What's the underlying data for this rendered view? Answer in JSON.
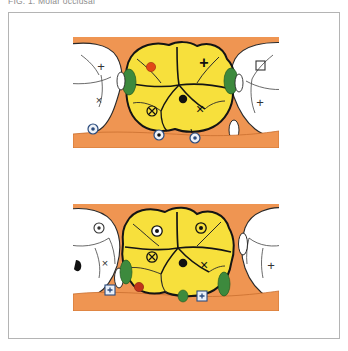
{
  "caption": {
    "text": "FIG. 1. Molar occlusal"
  },
  "figure": {
    "panels": [
      {
        "id": "panel-top",
        "label": "upper-molar-occlusal-view",
        "background_color": "#ef9552",
        "center_tooth": {
          "label": "central-molar-crown",
          "fill_color": "#f7e03c",
          "outline_color": "#1a1a1a"
        },
        "adjacent_teeth": [
          {
            "label": "left-adjacent-tooth",
            "fill_color": "#ffffff"
          },
          {
            "label": "right-adjacent-tooth",
            "fill_color": "#ffffff"
          }
        ],
        "interproximal_markers": [
          {
            "label": "mesial-contact-marker",
            "color": "#3d8a3d"
          },
          {
            "label": "distal-contact-marker",
            "color": "#3d8a3d"
          }
        ],
        "markers": [
          {
            "name": "red-dot-marker",
            "glyph": "●",
            "color": "#e24816"
          },
          {
            "name": "black-dot-marker",
            "glyph": "●",
            "color": "#111111"
          },
          {
            "name": "plus-marker",
            "glyph": "+",
            "color": "#111111"
          },
          {
            "name": "cross-marker-right",
            "glyph": "×",
            "color": "#111111"
          },
          {
            "name": "cross-marker-left",
            "glyph": "×",
            "color": "#333333"
          },
          {
            "name": "plus-marker-left",
            "glyph": "+",
            "color": "#333333"
          },
          {
            "name": "circled-cross-marker",
            "glyph": "⊗",
            "color": "#111111"
          },
          {
            "name": "square-marker-right",
            "glyph": "□",
            "color": "#333333"
          },
          {
            "name": "plus-marker-far-right",
            "glyph": "+",
            "color": "#333333"
          },
          {
            "name": "circled-dot-marker-1",
            "glyph": "◎",
            "color": "#2b4c7e"
          },
          {
            "name": "circled-dot-marker-2",
            "glyph": "◎",
            "color": "#2b4c7e"
          },
          {
            "name": "circled-dot-marker-3",
            "glyph": "◎",
            "color": "#2b4c7e"
          }
        ]
      },
      {
        "id": "panel-bottom",
        "label": "lower-molar-occlusal-view",
        "background_color": "#ef9552",
        "center_tooth": {
          "label": "central-molar-crown",
          "fill_color": "#f7e03c",
          "outline_color": "#1a1a1a"
        },
        "adjacent_teeth": [
          {
            "label": "left-adjacent-tooth",
            "fill_color": "#ffffff"
          },
          {
            "label": "right-adjacent-tooth",
            "fill_color": "#ffffff"
          }
        ],
        "interproximal_markers": [
          {
            "label": "mesial-contact-marker",
            "color": "#3d8a3d"
          },
          {
            "label": "distal-contact-marker",
            "color": "#3d8a3d"
          },
          {
            "label": "buccal-contact-marker",
            "color": "#3d8a3d"
          }
        ],
        "markers": [
          {
            "name": "circled-dot-marker-crown-left",
            "glyph": "◉",
            "color": "#111111"
          },
          {
            "name": "circled-dot-marker-crown-right",
            "glyph": "◎",
            "color": "#111111"
          },
          {
            "name": "circled-cross-marker",
            "glyph": "⊗",
            "color": "#111111"
          },
          {
            "name": "black-dot-marker",
            "glyph": "●",
            "color": "#111111"
          },
          {
            "name": "cross-marker-crown",
            "glyph": "×",
            "color": "#111111"
          },
          {
            "name": "circled-dot-marker-left-tooth",
            "glyph": "◎",
            "color": "#333333"
          },
          {
            "name": "cross-marker-left-tooth",
            "glyph": "×",
            "color": "#333333"
          },
          {
            "name": "plus-marker-right-tooth",
            "glyph": "+",
            "color": "#333333"
          },
          {
            "name": "red-dot-marker",
            "glyph": "●",
            "color": "#c0341b"
          },
          {
            "name": "boxed-plus-marker-left",
            "glyph": "+",
            "color": "#2b4c7e"
          },
          {
            "name": "boxed-plus-marker-right",
            "glyph": "+",
            "color": "#2b4c7e"
          }
        ]
      }
    ]
  }
}
